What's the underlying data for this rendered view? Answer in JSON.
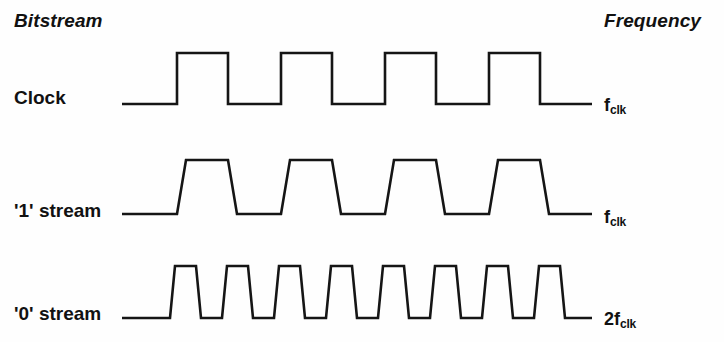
{
  "headers": {
    "left": "Bitstream",
    "right": "Frequency"
  },
  "rows": [
    {
      "label": "Clock",
      "freq_base": "f",
      "freq_sub": "clk",
      "freq_full": "f_clk",
      "waveform": "square",
      "pulses": 4,
      "edge_slope_px": 0
    },
    {
      "label": "'1' stream",
      "freq_base": "f",
      "freq_sub": "clk",
      "freq_full": "f_clk",
      "waveform": "trapezoid",
      "pulses": 4,
      "edge_slope_px": 9
    },
    {
      "label": "'0' stream",
      "freq_base": "2f",
      "freq_sub": "clk",
      "freq_full": "2f_clk",
      "waveform": "trapezoid",
      "pulses": 8,
      "edge_slope_px": 5
    }
  ],
  "chart_data": {
    "type": "line",
    "xlabel": "",
    "ylabel": "",
    "grid": false,
    "legend": "none",
    "traces": [
      {
        "name": "Clock",
        "frequency": "f_clk",
        "cycles": 4,
        "duty_cycle_pct": 50,
        "edges": "sharp",
        "x_start": 122,
        "x_end": 592,
        "baseline_y": 104,
        "high_y": 53,
        "period_px": 104,
        "first_rise_x": 177,
        "first_fall_x": 228
      },
      {
        "name": "'1' stream",
        "frequency": "f_clk",
        "cycles": 4,
        "duty_cycle_pct": 50,
        "edges": "sloped",
        "x_start": 122,
        "x_end": 592,
        "baseline_y": 214,
        "high_y": 160,
        "period_px": 104,
        "first_rise_x": 177,
        "first_fall_x": 228
      },
      {
        "name": "'0' stream",
        "frequency": "2f_clk",
        "cycles": 8,
        "duty_cycle_pct": 50,
        "edges": "sloped",
        "x_start": 122,
        "x_end": 592,
        "baseline_y": 318,
        "high_y": 266,
        "period_px": 52,
        "first_rise_x": 170,
        "first_fall_x": 196
      }
    ]
  }
}
